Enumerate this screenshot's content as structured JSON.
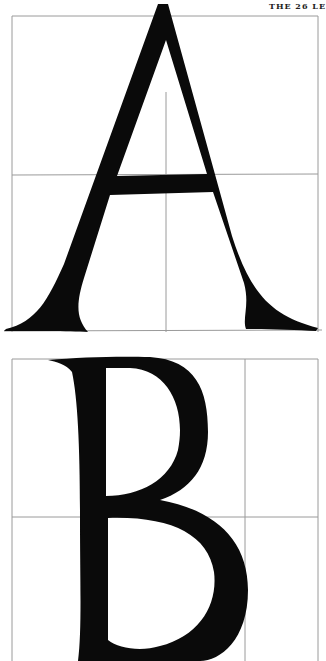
{
  "page": {
    "running_head": "THE 26 LE"
  },
  "plates": [
    {
      "letter": "A",
      "label": "Letter A construction"
    },
    {
      "letter": "B",
      "label": "Letter B construction"
    }
  ],
  "colors": {
    "ink": "#0a0a0a",
    "grid": "#9a9a9a",
    "paper": "#ffffff"
  }
}
